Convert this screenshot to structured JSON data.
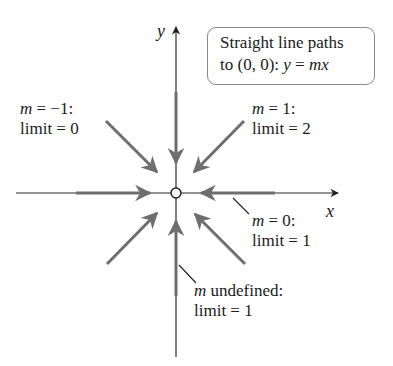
{
  "diagram": {
    "type": "coordinate-plane-limit-paths",
    "axes": {
      "x_label": "x",
      "y_label": "y"
    },
    "origin_point": "open-circle at (0, 0)",
    "callout": {
      "line1": "Straight line paths",
      "line2_prefix": "to (0, 0): ",
      "line2_y": "y",
      "line2_eq": " = ",
      "line2_mx": "mx"
    },
    "paths": [
      {
        "id": "m-neg-1",
        "m_var": "m",
        "condition": " = −1:",
        "result": "limit = 0",
        "direction": "from upper-left"
      },
      {
        "id": "m-1",
        "m_var": "m",
        "condition": " = 1:",
        "result": "limit = 2",
        "direction": "from upper-right"
      },
      {
        "id": "m-0",
        "m_var": "m",
        "condition": " = 0:",
        "result": "limit = 1",
        "direction": "along x-axis"
      },
      {
        "id": "m-undefined",
        "m_var": "m",
        "condition": " undefined:",
        "result": "limit = 1",
        "direction": "along y-axis"
      }
    ],
    "colors": {
      "axis": "#2a2a2a",
      "arrow": "#6e6e6e",
      "text": "#1a1a1a",
      "callout_border": "#8a8a8a"
    }
  }
}
